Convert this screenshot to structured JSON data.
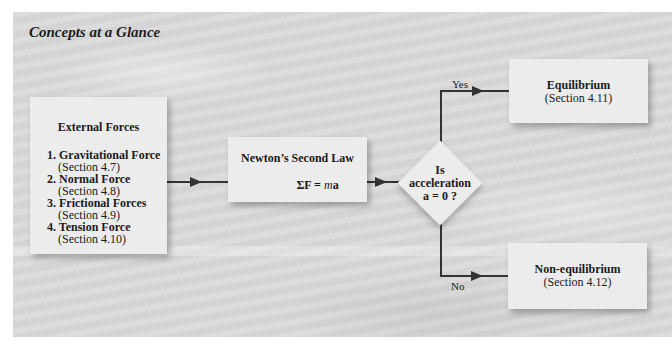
{
  "title": "Concepts at a Glance",
  "external_forces": {
    "title": "External Forces",
    "items": [
      {
        "label": "1. Gravitational Force",
        "section": "(Section 4.7)"
      },
      {
        "label": "2. Normal Force",
        "section": "(Section 4.8)"
      },
      {
        "label": "3. Frictional Forces",
        "section": "(Section 4.9)"
      },
      {
        "label": "4. Tension Force",
        "section": "(Section 4.10)"
      }
    ]
  },
  "newton": {
    "title": "Newton’s Second Law",
    "equation_left": "ΣF = ",
    "equation_m": "m",
    "equation_a": "a"
  },
  "decision": {
    "line1": "Is",
    "line2": "acceleration",
    "line3": "a = 0 ?"
  },
  "branches": {
    "yes_label": "Yes",
    "no_label": "No"
  },
  "equilibrium": {
    "title": "Equilibrium",
    "section": "(Section 4.11)"
  },
  "non_equilibrium": {
    "title": "Non-equilibrium",
    "section": "(Section 4.12)"
  },
  "colors": {
    "background": "#d9d9d9",
    "box_fill": "#ececec",
    "line": "#333333"
  }
}
